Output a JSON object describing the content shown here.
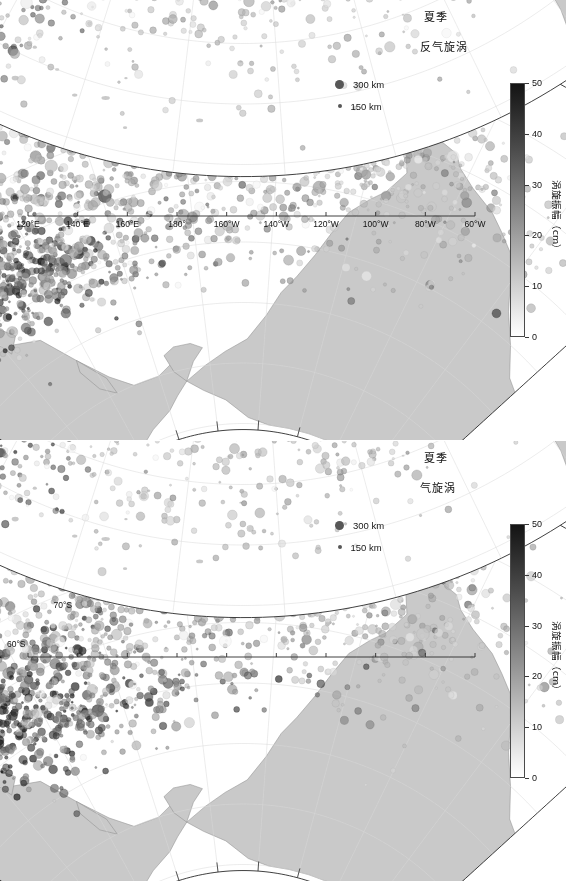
{
  "figure": {
    "colors": {
      "land": "#c9c9c9",
      "ocean": "#ffffff",
      "coastline": "#8a8a8a",
      "graticule": "#d8d8d8",
      "frame": "#2b2b2b",
      "cbar_low": "#ffffff",
      "cbar_high": "#141414"
    }
  },
  "panels": [
    {
      "id": "anticyclonic",
      "season_label": "夏季",
      "type_label": "反气旋涡",
      "size_legend": {
        "large": {
          "label": "300 km",
          "icon": "large-dot-icon"
        },
        "small": {
          "label": "150 km",
          "icon": "small-dot-icon"
        }
      },
      "colorbar": {
        "title": "涡旋振幅（cm）",
        "min": 0,
        "max": 50,
        "ticks": [
          0,
          10,
          20,
          30,
          40,
          50
        ],
        "unit": "cm"
      },
      "north": {
        "lat_ticks": [
          "0°",
          "10°N",
          "20°N",
          "30°N",
          "40°N",
          "50°N",
          "60°N",
          "70°N"
        ],
        "lon_ticks": [
          "120°E",
          "140°E",
          "160°E",
          "180°",
          "160°W",
          "140°W",
          "120°W",
          "100°W",
          "80°W",
          "60°W"
        ]
      },
      "south": {
        "lat_ticks": [
          "10°S",
          "20°S",
          "30°S",
          "40°S",
          "50°S",
          "60°S",
          "70°S"
        ]
      }
    },
    {
      "id": "cyclonic",
      "season_label": "夏季",
      "type_label": "气旋涡",
      "size_legend": {
        "large": {
          "label": "300 km",
          "icon": "large-dot-icon"
        },
        "small": {
          "label": "150 km",
          "icon": "small-dot-icon"
        }
      },
      "colorbar": {
        "title": "涡旋振幅（cm）",
        "min": 0,
        "max": 50,
        "ticks": [
          0,
          10,
          20,
          30,
          40,
          50
        ],
        "unit": "cm"
      },
      "north": {
        "lat_ticks": [
          "0°",
          "10°N",
          "20°N",
          "30°N",
          "40°N",
          "50°N",
          "60°N",
          "70°N"
        ],
        "lon_ticks": [
          "120°E",
          "140°E",
          "160°E",
          "180°",
          "160°W",
          "140°W",
          "120°W",
          "100°W",
          "80°W",
          "60°W"
        ]
      },
      "south": {
        "lat_ticks": [
          "10°S",
          "20°S",
          "30°S",
          "40°S",
          "50°S",
          "60°S",
          "70°S"
        ]
      }
    }
  ],
  "chart_data": {
    "type": "scatter",
    "xlabel": "",
    "ylabel": "",
    "projection": "conic",
    "grid": true,
    "legend_position": "inside-top-right",
    "xlim": [
      120,
      300
    ],
    "ylim": [
      -75,
      72
    ],
    "lon_range": [
      "120°E",
      "60°W"
    ],
    "colorbar": {
      "label": "涡旋振幅（cm）",
      "min": 0,
      "max": 50,
      "ticks": [
        0,
        10,
        20,
        30,
        40,
        50
      ]
    },
    "size_encoding": {
      "variable": "eddy radius",
      "levels_km": [
        150,
        300
      ]
    },
    "series": [
      {
        "name": "反气旋涡 (anticyclonic) — Northern Hemisphere",
        "panel": "anticyclonic-north",
        "clusters": [
          {
            "region": "Kuroshio Extension",
            "lon_center": 147,
            "lat_center": 34,
            "lon_spread": 16,
            "lat_spread": 5,
            "count": 430,
            "amp_mean": 34,
            "amp_spread": 12,
            "radius_mean_km": 190
          },
          {
            "region": "Subtropical North Pacific band",
            "lon_center": 175,
            "lat_center": 25,
            "lon_spread": 42,
            "lat_spread": 7,
            "count": 620,
            "amp_mean": 16,
            "amp_spread": 7,
            "radius_mean_km": 200
          },
          {
            "region": "Central Pacific 20N",
            "lon_center": 215,
            "lat_center": 21,
            "lon_spread": 34,
            "lat_spread": 6,
            "count": 430,
            "amp_mean": 12,
            "amp_spread": 5,
            "radius_mean_km": 190
          },
          {
            "region": "Eastern Pacific / California",
            "lon_center": 245,
            "lat_center": 24,
            "lon_spread": 16,
            "lat_spread": 8,
            "count": 190,
            "amp_mean": 10,
            "amp_spread": 4,
            "radius_mean_km": 170
          },
          {
            "region": "Tropical 10N",
            "lon_center": 160,
            "lat_center": 11,
            "lon_spread": 30,
            "lat_spread": 4,
            "count": 120,
            "amp_mean": 9,
            "amp_spread": 4,
            "radius_mean_km": 230
          },
          {
            "region": "North Pacific 40N",
            "lon_center": 180,
            "lat_center": 40,
            "lon_spread": 28,
            "lat_spread": 4,
            "count": 200,
            "amp_mean": 18,
            "amp_spread": 8,
            "radius_mean_km": 170
          }
        ]
      },
      {
        "name": "反气旋涡 (anticyclonic) — Southern Hemisphere",
        "panel": "anticyclonic-south",
        "clusters": [
          {
            "region": "East Australia Current",
            "lon_center": 155,
            "lat_center": -35,
            "lon_spread": 9,
            "lat_spread": 8,
            "count": 260,
            "amp_mean": 26,
            "amp_spread": 11,
            "radius_mean_km": 180
          },
          {
            "region": "Antarctic Circumpolar Current",
            "lon_center": 205,
            "lat_center": -53,
            "lon_spread": 55,
            "lat_spread": 5,
            "count": 640,
            "amp_mean": 18,
            "amp_spread": 8,
            "radius_mean_km": 150
          },
          {
            "region": "South Pacific subtropics",
            "lon_center": 195,
            "lat_center": -33,
            "lon_spread": 42,
            "lat_spread": 8,
            "count": 330,
            "amp_mean": 11,
            "amp_spread": 5,
            "radius_mean_km": 180
          },
          {
            "region": "Southeast Pacific",
            "lon_center": 255,
            "lat_center": -45,
            "lon_spread": 25,
            "lat_spread": 8,
            "count": 240,
            "amp_mean": 13,
            "amp_spread": 6,
            "radius_mean_km": 160
          }
        ]
      },
      {
        "name": "气旋涡 (cyclonic) — Northern Hemisphere",
        "panel": "cyclonic-north",
        "clusters": [
          {
            "region": "Kuroshio Extension",
            "lon_center": 148,
            "lat_center": 33,
            "lon_spread": 17,
            "lat_spread": 6,
            "count": 520,
            "amp_mean": 38,
            "amp_spread": 12,
            "radius_mean_km": 195
          },
          {
            "region": "Subtropical North Pacific band",
            "lon_center": 172,
            "lat_center": 24,
            "lon_spread": 40,
            "lat_spread": 7,
            "count": 600,
            "amp_mean": 18,
            "amp_spread": 8,
            "radius_mean_km": 200
          },
          {
            "region": "Central Pacific 20N",
            "lon_center": 212,
            "lat_center": 20,
            "lon_spread": 33,
            "lat_spread": 6,
            "count": 400,
            "amp_mean": 12,
            "amp_spread": 5,
            "radius_mean_km": 190
          },
          {
            "region": "Eastern Pacific / California",
            "lon_center": 243,
            "lat_center": 23,
            "lon_spread": 16,
            "lat_spread": 8,
            "count": 180,
            "amp_mean": 10,
            "amp_spread": 4,
            "radius_mean_km": 175
          },
          {
            "region": "Tropical 10N",
            "lon_center": 158,
            "lat_center": 10,
            "lon_spread": 28,
            "lat_spread": 4,
            "count": 110,
            "amp_mean": 9,
            "amp_spread": 4,
            "radius_mean_km": 240
          },
          {
            "region": "North Pacific 40N",
            "lon_center": 178,
            "lat_center": 39,
            "lon_spread": 28,
            "lat_spread": 4,
            "count": 210,
            "amp_mean": 20,
            "amp_spread": 9,
            "radius_mean_km": 175
          }
        ]
      },
      {
        "name": "气旋涡 (cyclonic) — Southern Hemisphere",
        "panel": "cyclonic-south",
        "clusters": [
          {
            "region": "East Australia Current",
            "lon_center": 154,
            "lat_center": -34,
            "lon_spread": 9,
            "lat_spread": 9,
            "count": 300,
            "amp_mean": 27,
            "amp_spread": 11,
            "radius_mean_km": 180
          },
          {
            "region": "Antarctic Circumpolar Current",
            "lon_center": 203,
            "lat_center": -52,
            "lon_spread": 56,
            "lat_spread": 5,
            "count": 700,
            "amp_mean": 20,
            "amp_spread": 9,
            "radius_mean_km": 155
          },
          {
            "region": "South Pacific subtropics",
            "lon_center": 193,
            "lat_center": -32,
            "lon_spread": 42,
            "lat_spread": 8,
            "count": 340,
            "amp_mean": 12,
            "amp_spread": 5,
            "radius_mean_km": 180
          },
          {
            "region": "Southeast Pacific",
            "lon_center": 253,
            "lat_center": -44,
            "lon_spread": 26,
            "lat_spread": 9,
            "count": 260,
            "amp_mean": 14,
            "amp_spread": 6,
            "radius_mean_km": 165
          }
        ]
      }
    ]
  }
}
